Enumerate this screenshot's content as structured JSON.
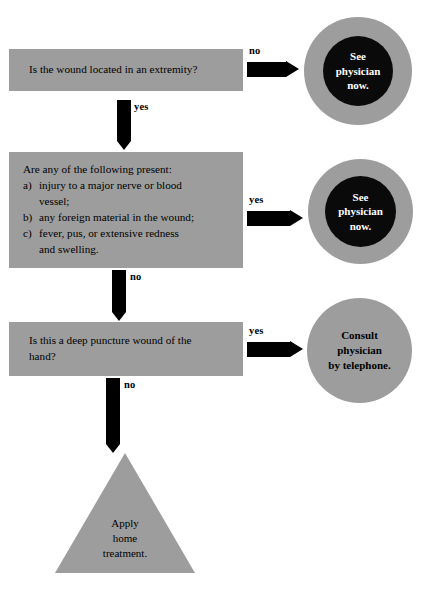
{
  "diagram": {
    "colors": {
      "box_gray": "#9d9d9d",
      "circle_gray": "#9d9d9d",
      "circle_core_black": "#0a0a0a",
      "arrow_black": "#000000",
      "background": "#ffffff",
      "text_dark": "#000000",
      "text_light": "#ffffff"
    },
    "nodes": {
      "q1": {
        "type": "decision",
        "text": "Is the wound located in an extremity?"
      },
      "q2": {
        "type": "decision",
        "stem": "Are any of the following present:",
        "items": [
          {
            "marker": "a)",
            "line1": "injury to a major nerve or blood",
            "line2": "vessel;"
          },
          {
            "marker": "b)",
            "line1": "any foreign material in the wound;",
            "line2": ""
          },
          {
            "marker": "c)",
            "line1": "fever, pus, or extensive redness",
            "line2": "and swelling."
          }
        ]
      },
      "q3": {
        "type": "decision",
        "line1": "Is this a deep puncture wound of the",
        "line2": "hand?"
      },
      "out1": {
        "type": "terminator-ring",
        "line1": "See",
        "line2": "physician",
        "line3": "now."
      },
      "out2": {
        "type": "terminator-ring",
        "line1": "See",
        "line2": "physician",
        "line3": "now."
      },
      "out3": {
        "type": "terminator-solid",
        "line1": "Consult",
        "line2": "physician",
        "line3": "by telephone."
      },
      "out4": {
        "type": "terminator-triangle",
        "line1": "Apply",
        "line2": "home",
        "line3": "treatment."
      }
    },
    "edges": {
      "q1_no": "no",
      "q1_yes": "yes",
      "q2_yes": "yes",
      "q2_no": "no",
      "q3_yes": "yes",
      "q3_no": "no"
    }
  }
}
